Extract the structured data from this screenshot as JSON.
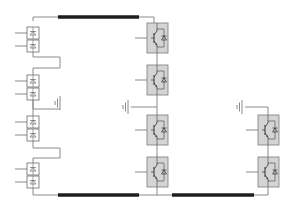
{
  "diagram": {
    "title": "",
    "colors": {
      "wire": "#8a8a8a",
      "bus": "#1e1e1e",
      "module_fill": "#d4d4d4",
      "module_stroke": "#7a7a7a",
      "diode_fill": "#ffffff",
      "diode_stroke": "#6a6a6a"
    },
    "diode_boxes": [
      {
        "x": 27,
        "y": 27
      },
      {
        "x": 27,
        "y": 40
      },
      {
        "x": 27,
        "y": 75
      },
      {
        "x": 27,
        "y": 88
      },
      {
        "x": 27,
        "y": 116
      },
      {
        "x": 27,
        "y": 129
      },
      {
        "x": 27,
        "y": 163
      },
      {
        "x": 27,
        "y": 176
      }
    ],
    "igbt_modules": [
      {
        "x": 147,
        "y": 23
      },
      {
        "x": 147,
        "y": 65
      },
      {
        "x": 147,
        "y": 115
      },
      {
        "x": 147,
        "y": 157
      },
      {
        "x": 258,
        "y": 115
      },
      {
        "x": 258,
        "y": 157
      }
    ],
    "buses": [
      {
        "x1": 58,
        "x2": 139,
        "y": 17
      },
      {
        "x1": 58,
        "x2": 139,
        "y": 195
      },
      {
        "x1": 172,
        "x2": 254,
        "y": 195
      }
    ],
    "grounds": [
      {
        "x": 60,
        "y": 103
      },
      {
        "x": 128,
        "y": 107
      },
      {
        "x": 242,
        "y": 107
      }
    ]
  }
}
